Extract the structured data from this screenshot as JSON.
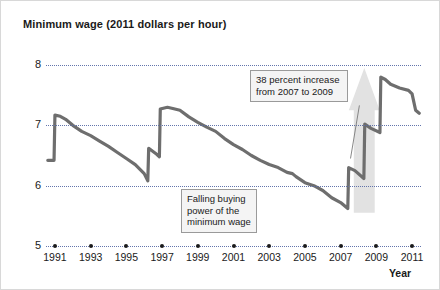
{
  "chart_data": {
    "type": "line",
    "title": "Minimum wage (2011 dollars per hour)",
    "xlabel": "Year",
    "ylabel": "",
    "xlim": [
      1990.5,
      2011.5
    ],
    "ylim": [
      5,
      8
    ],
    "yticks": [
      "5",
      "6",
      "7",
      "8"
    ],
    "ytick_values": [
      5,
      6,
      7,
      8
    ],
    "xticks": [
      "1991",
      "1993",
      "1995",
      "1997",
      "1999",
      "2001",
      "2003",
      "2005",
      "2007",
      "2009",
      "2011"
    ],
    "xtick_values": [
      1991,
      1993,
      1995,
      1997,
      1999,
      2001,
      2003,
      2005,
      2007,
      2009,
      2011
    ],
    "grid": "horizontal-dotted",
    "legend": "none",
    "series": [
      {
        "name": "Minimum wage in 2011 dollars",
        "color": "#6e6e6e",
        "x": [
          1990.6,
          1990.95,
          1991.0,
          1991.3,
          1991.6,
          1992.0,
          1992.5,
          1993.0,
          1993.5,
          1994.0,
          1994.5,
          1995.0,
          1995.5,
          1996.0,
          1996.2,
          1996.25,
          1996.7,
          1996.85,
          1996.9,
          1997.3,
          1997.6,
          1998.0,
          1998.5,
          1999.0,
          1999.5,
          2000.0,
          2000.5,
          2001.0,
          2001.5,
          2002.0,
          2002.5,
          2003.0,
          2003.5,
          2004.0,
          2004.3,
          2004.5,
          2005.0,
          2005.5,
          2006.0,
          2006.5,
          2007.0,
          2007.4,
          2007.45,
          2007.8,
          2008.3,
          2008.35,
          2008.7,
          2009.2,
          2009.25,
          2009.5,
          2009.8,
          2010.3,
          2010.8,
          2011.0,
          2011.2,
          2011.4
        ],
        "y": [
          6.42,
          6.42,
          7.17,
          7.15,
          7.1,
          7.0,
          6.9,
          6.83,
          6.74,
          6.65,
          6.55,
          6.45,
          6.35,
          6.2,
          6.08,
          6.62,
          6.52,
          6.48,
          7.27,
          7.3,
          7.28,
          7.25,
          7.14,
          7.05,
          6.97,
          6.9,
          6.78,
          6.68,
          6.6,
          6.5,
          6.42,
          6.35,
          6.3,
          6.22,
          6.2,
          6.15,
          6.05,
          6.0,
          5.92,
          5.8,
          5.72,
          5.62,
          6.3,
          6.25,
          6.12,
          7.02,
          6.95,
          6.88,
          7.8,
          7.76,
          7.68,
          7.62,
          7.58,
          7.52,
          7.25,
          7.2
        ]
      }
    ],
    "annotations": [
      {
        "id": "increase",
        "text": "38 percent increase\nfrom 2007 to 2009",
        "leader_from": [
          2008.05,
          7.33
        ],
        "leader_to": [
          2007.55,
          6.45
        ]
      },
      {
        "id": "falling",
        "text": "Falling buying\npower of the\nminimum wage",
        "leader_from": null,
        "leader_to": null
      }
    ],
    "arrow_highlight": {
      "description": "light gray upward arrow behind the 2007 to 2009 rise",
      "color": "#e2e2e2",
      "from_year": 2007.4,
      "to_year": 2009.3
    }
  }
}
